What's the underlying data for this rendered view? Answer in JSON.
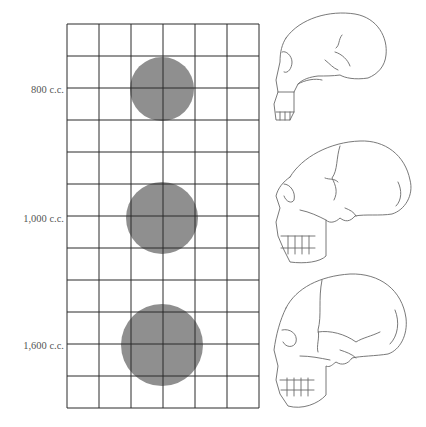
{
  "figure": {
    "grid": {
      "left": 67,
      "top": 24,
      "cell": 32,
      "columns": 6,
      "rows": 12,
      "line_color": "#2a2a2a"
    },
    "circle_color": "#8f8f8f",
    "rows": [
      {
        "label": "800 c.c.",
        "volume_cc": 800,
        "circle": {
          "cx": 162,
          "cy": 89,
          "r": 32
        },
        "label_y": 84,
        "skull": "small-archaic-skull"
      },
      {
        "label": "1,000 c.c.",
        "volume_cc": 1000,
        "circle": {
          "cx": 162,
          "cy": 218,
          "r": 36
        },
        "label_y": 213,
        "skull": "medium-skull"
      },
      {
        "label": "1,600 c.c.",
        "volume_cc": 1600,
        "circle": {
          "cx": 162,
          "cy": 345,
          "r": 41
        },
        "label_y": 340,
        "skull": "large-modern-skull"
      }
    ]
  }
}
